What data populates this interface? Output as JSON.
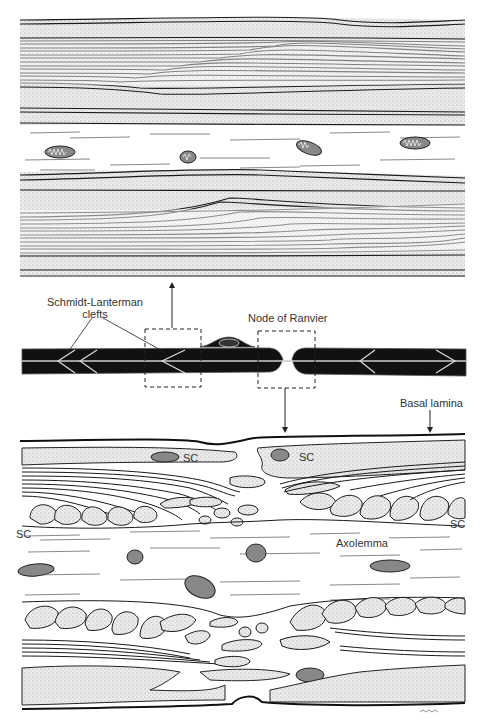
{
  "figure": {
    "panels": [
      {
        "id": "top",
        "description": "Longitudinal section through myelin sheath at Schmidt-Lanterman clefts"
      },
      {
        "id": "middle",
        "description": "Schematic of myelinated fiber with Schmidt-Lanterman clefts and Node of Ranvier"
      },
      {
        "id": "bottom",
        "description": "Enlarged longitudinal section at Node of Ranvier"
      }
    ]
  },
  "labels": {
    "schmidt_lanterman_line1": "Schmidt-Lanterman",
    "schmidt_lanterman_line2": "clefts",
    "node_of_ranvier": "Node of Ranvier",
    "basal_lamina": "Basal lamina",
    "axolemma": "Axolemma",
    "sc_1": "SC",
    "sc_2": "SC",
    "sc_3": "SC",
    "sc_4": "SC"
  },
  "colors": {
    "ink": "#1a1a1a",
    "stipple": "#d9d9d9",
    "paper": "#ffffff",
    "fiber": "#111111"
  }
}
